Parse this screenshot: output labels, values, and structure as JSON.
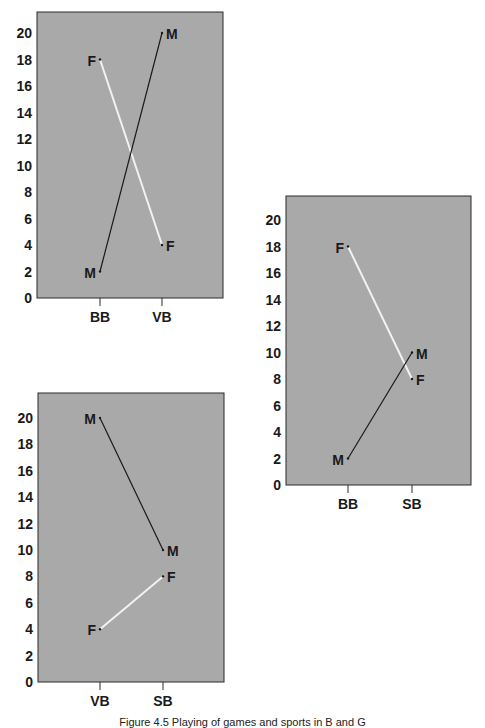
{
  "chart_data": [
    {
      "type": "line",
      "id": "chart-bb-vb",
      "categories": [
        "BB",
        "VB"
      ],
      "series": [
        {
          "name": "F",
          "values": [
            18,
            4
          ],
          "color": "#f2f2f2"
        },
        {
          "name": "M",
          "values": [
            2,
            20
          ],
          "color": "#1a1a1a"
        }
      ],
      "yticks": [
        0,
        2,
        4,
        6,
        8,
        10,
        12,
        14,
        16,
        18,
        20
      ],
      "ylim": [
        0,
        21
      ],
      "grid": false,
      "background": "#a9a9a9"
    },
    {
      "type": "line",
      "id": "chart-bb-sb",
      "categories": [
        "BB",
        "SB"
      ],
      "series": [
        {
          "name": "F",
          "values": [
            18,
            8
          ],
          "color": "#f2f2f2"
        },
        {
          "name": "M",
          "values": [
            2,
            10
          ],
          "color": "#1a1a1a"
        }
      ],
      "yticks": [
        0,
        2,
        4,
        6,
        8,
        10,
        12,
        14,
        16,
        18,
        20
      ],
      "ylim": [
        0,
        21
      ],
      "grid": false,
      "background": "#a9a9a9"
    },
    {
      "type": "line",
      "id": "chart-vb-sb",
      "categories": [
        "VB",
        "SB"
      ],
      "series": [
        {
          "name": "M",
          "values": [
            20,
            10
          ],
          "color": "#1a1a1a"
        },
        {
          "name": "F",
          "values": [
            4,
            8
          ],
          "color": "#f2f2f2"
        }
      ],
      "yticks": [
        0,
        2,
        4,
        6,
        8,
        10,
        12,
        14,
        16,
        18,
        20
      ],
      "ylim": [
        0,
        21
      ],
      "grid": false,
      "background": "#a9a9a9"
    }
  ],
  "layout": [
    {
      "left": 0,
      "top": 0,
      "frameX": 37,
      "frameY": 12,
      "frameW": 186,
      "frameH": 286,
      "zeroY": 298,
      "twentyY": 33,
      "catX": [
        100,
        162
      ]
    },
    {
      "left": 0,
      "top": 0,
      "frameX": 286,
      "frameY": 196,
      "frameW": 185,
      "frameH": 289,
      "zeroY": 485,
      "twentyY": 220,
      "catX": [
        348,
        412
      ]
    },
    {
      "left": 0,
      "top": 0,
      "frameX": 38,
      "frameY": 393,
      "frameW": 186,
      "frameH": 289,
      "zeroY": 682,
      "twentyY": 418,
      "catX": [
        100,
        163
      ]
    }
  ],
  "caption": "Figure 4.5 Playing of games and sports in B and G"
}
